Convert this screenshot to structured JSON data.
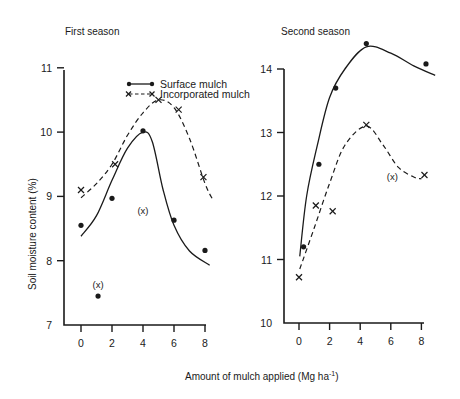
{
  "figure": {
    "x_axis_label": "Amount of mulch applied (Mg ha",
    "x_axis_label_sup": "-1",
    "x_axis_label_end": ")",
    "y_axis_label": "Soil moisture content  (%)",
    "legend": {
      "surface": "Surface mulch",
      "incorporated": "Incorporated mulch"
    },
    "outlier_marker": "(x)"
  },
  "chart_data": [
    {
      "type": "line",
      "title": "First season",
      "xlabel": "Amount of mulch applied (Mg ha-1)",
      "ylabel": "Soil moisture content (%)",
      "xlim": [
        0,
        8
      ],
      "ylim": [
        7,
        11
      ],
      "xticks": [
        "0",
        "2",
        "4",
        "6",
        "8"
      ],
      "yticks": [
        "7",
        "8",
        "9",
        "10",
        "11"
      ],
      "legend_position": "upper center",
      "grid": false,
      "series": [
        {
          "name": "Surface mulch",
          "style": "solid line with filled circle markers",
          "points": [
            {
              "x": 0,
              "y": 8.55
            },
            {
              "x": 2,
              "y": 8.97
            },
            {
              "x": 4,
              "y": 10.02
            },
            {
              "x": 6,
              "y": 8.63
            },
            {
              "x": 8,
              "y": 8.16
            }
          ],
          "fitted_curve": [
            {
              "x": 0,
              "y": 8.38
            },
            {
              "x": 1,
              "y": 8.7
            },
            {
              "x": 2,
              "y": 9.25
            },
            {
              "x": 3,
              "y": 9.75
            },
            {
              "x": 4,
              "y": 10.0
            },
            {
              "x": 4.6,
              "y": 9.85
            },
            {
              "x": 5.3,
              "y": 9.1
            },
            {
              "x": 6,
              "y": 8.55
            },
            {
              "x": 7,
              "y": 8.15
            },
            {
              "x": 8.3,
              "y": 7.93
            }
          ]
        },
        {
          "name": "Incorporated mulch",
          "style": "dashed line with x markers",
          "points": [
            {
              "x": 0,
              "y": 9.1
            },
            {
              "x": 2.2,
              "y": 9.5
            },
            {
              "x": 5,
              "y": 10.5
            },
            {
              "x": 6.3,
              "y": 10.35
            },
            {
              "x": 7.9,
              "y": 9.3
            }
          ],
          "fitted_curve": [
            {
              "x": 0,
              "y": 8.98
            },
            {
              "x": 1,
              "y": 9.2
            },
            {
              "x": 2,
              "y": 9.5
            },
            {
              "x": 3,
              "y": 9.95
            },
            {
              "x": 4,
              "y": 10.3
            },
            {
              "x": 5,
              "y": 10.5
            },
            {
              "x": 6,
              "y": 10.38
            },
            {
              "x": 7,
              "y": 9.9
            },
            {
              "x": 8,
              "y": 9.2
            },
            {
              "x": 8.5,
              "y": 8.95
            }
          ]
        }
      ],
      "annotations": [
        {
          "text": "(x)",
          "x": 4.0,
          "y": 8.78,
          "note": "excluded point label"
        },
        {
          "text": "(x)",
          "x": 1.1,
          "y": 7.62,
          "note": "excluded point label",
          "point": {
            "x": 1.1,
            "y": 7.45
          }
        }
      ]
    },
    {
      "type": "line",
      "title": "Second season",
      "xlabel": "Amount of mulch applied (Mg ha-1)",
      "ylabel": "Soil moisture content (%)",
      "xlim": [
        0,
        8
      ],
      "ylim": [
        10,
        14
      ],
      "xticks": [
        "0",
        "2",
        "4",
        "6",
        "8"
      ],
      "yticks": [
        "10",
        "11",
        "12",
        "13",
        "14"
      ],
      "grid": false,
      "series": [
        {
          "name": "Surface mulch",
          "style": "solid line with filled circle markers",
          "points": [
            {
              "x": 0.3,
              "y": 11.2
            },
            {
              "x": 1.3,
              "y": 12.5
            },
            {
              "x": 2.4,
              "y": 13.7
            },
            {
              "x": 4.4,
              "y": 14.4
            },
            {
              "x": 8.3,
              "y": 14.08
            }
          ],
          "fitted_curve": [
            {
              "x": 0.05,
              "y": 11.05
            },
            {
              "x": 0.5,
              "y": 12.0
            },
            {
              "x": 1.2,
              "y": 12.8
            },
            {
              "x": 2.0,
              "y": 13.55
            },
            {
              "x": 3.0,
              "y": 14.0
            },
            {
              "x": 4.4,
              "y": 14.35
            },
            {
              "x": 6.0,
              "y": 14.25
            },
            {
              "x": 7.5,
              "y": 14.05
            },
            {
              "x": 8.9,
              "y": 13.9
            }
          ]
        },
        {
          "name": "Incorporated mulch",
          "style": "dashed line with x markers",
          "points": [
            {
              "x": 0,
              "y": 10.72
            },
            {
              "x": 1.1,
              "y": 11.85
            },
            {
              "x": 2.2,
              "y": 11.76
            },
            {
              "x": 4.4,
              "y": 13.12
            },
            {
              "x": 8.2,
              "y": 12.33
            }
          ],
          "fitted_curve": [
            {
              "x": 0.05,
              "y": 10.85
            },
            {
              "x": 1.0,
              "y": 11.5
            },
            {
              "x": 2.0,
              "y": 12.2
            },
            {
              "x": 3.0,
              "y": 12.8
            },
            {
              "x": 4.4,
              "y": 13.1
            },
            {
              "x": 5.5,
              "y": 12.8
            },
            {
              "x": 6.5,
              "y": 12.45
            },
            {
              "x": 7.5,
              "y": 12.3
            },
            {
              "x": 8.0,
              "y": 12.27
            }
          ]
        }
      ],
      "annotations": [
        {
          "text": "(x)",
          "x": 6.1,
          "y": 12.3,
          "note": "excluded point label"
        }
      ]
    }
  ]
}
